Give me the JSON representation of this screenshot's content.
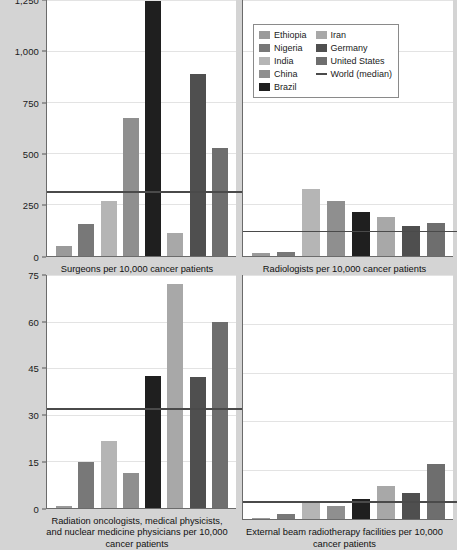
{
  "figure": {
    "background": "#d4d4d4",
    "plot_background": "#ffffff",
    "median_line_color": "#4a4a4a"
  },
  "legend": {
    "position": "top-right",
    "columns": [
      {
        "entries": [
          {
            "label": "Ethiopia",
            "color": "#9a9a9a",
            "marker": "swatch"
          },
          {
            "label": "Nigeria",
            "color": "#787878",
            "marker": "swatch"
          },
          {
            "label": "India",
            "color": "#b5b5b5",
            "marker": "swatch"
          },
          {
            "label": "China",
            "color": "#8f8f8f",
            "marker": "swatch"
          },
          {
            "label": "Brazil",
            "color": "#1f1f1f",
            "marker": "swatch"
          }
        ]
      },
      {
        "entries": [
          {
            "label": "Iran",
            "color": "#a8a8a8",
            "marker": "swatch"
          },
          {
            "label": "Germany",
            "color": "#4f4f4f",
            "marker": "swatch"
          },
          {
            "label": "United States",
            "color": "#6e6e6e",
            "marker": "swatch"
          },
          {
            "label": "World (median)",
            "color": "#4a4a4a",
            "marker": "line"
          }
        ]
      }
    ]
  },
  "series_colors": {
    "Ethiopia": "#9a9a9a",
    "Nigeria": "#787878",
    "India": "#b5b5b5",
    "China": "#8f8f8f",
    "Brazil": "#1f1f1f",
    "Iran": "#a8a8a8",
    "Germany": "#4f4f4f",
    "United States": "#6e6e6e"
  },
  "chart_data": [
    {
      "id": "surgeons",
      "type": "bar",
      "title": "",
      "xlabel": "Surgeons per 10,000 cancer patients",
      "ylabel": "",
      "ylim": [
        0,
        1250
      ],
      "yticks": [
        0,
        250,
        500,
        750,
        1000,
        1250
      ],
      "ytick_labels": [
        "0",
        "250",
        "500",
        "750",
        "1,000",
        "1,250"
      ],
      "grid": true,
      "categories": [
        "Ethiopia",
        "Nigeria",
        "India",
        "China",
        "Brazil",
        "Iran",
        "Germany",
        "United States"
      ],
      "values": [
        48,
        155,
        265,
        675,
        1243,
        108,
        888,
        528
      ],
      "annotations": [
        {
          "name": "World (median)",
          "type": "hline",
          "value": 308
        }
      ]
    },
    {
      "id": "radiologists",
      "type": "bar",
      "title": "",
      "xlabel": "Radiologists per 10,000 cancer patients",
      "ylabel": "",
      "ylim": [
        0,
        1250
      ],
      "yticks": [
        0,
        250,
        500,
        750,
        1000,
        1250
      ],
      "ytick_labels": [
        "0",
        "250",
        "500",
        "750",
        "1,000",
        "1,250"
      ],
      "grid": true,
      "categories": [
        "Ethiopia",
        "Nigeria",
        "India",
        "China",
        "Brazil",
        "Iran",
        "Germany",
        "United States"
      ],
      "values": [
        10,
        18,
        325,
        265,
        213,
        190,
        145,
        158
      ],
      "annotations": [
        {
          "name": "World (median)",
          "type": "hline",
          "value": 113
        }
      ]
    },
    {
      "id": "radiation-oncologists",
      "type": "bar",
      "title": "",
      "xlabel": "Radiation oncologists, medical physicists, and nuclear medicine physicians per 10,000 cancer patients",
      "ylabel": "",
      "ylim": [
        0,
        75
      ],
      "yticks": [
        0,
        15,
        30,
        45,
        60,
        75
      ],
      "ytick_labels": [
        "0",
        "15",
        "30",
        "45",
        "60",
        "75"
      ],
      "grid": true,
      "categories": [
        "Ethiopia",
        "Nigeria",
        "India",
        "China",
        "Brazil",
        "Iran",
        "Germany",
        "United States"
      ],
      "values": [
        0.4,
        14.8,
        21.5,
        11.0,
        42.3,
        72.0,
        42.0,
        60.0
      ],
      "annotations": [
        {
          "name": "World (median)",
          "type": "hline",
          "value": 31.5
        }
      ]
    },
    {
      "id": "radiotherapy-facilities",
      "type": "bar",
      "title": "",
      "xlabel": "External beam radiotherapy facilities per 10,000 cancer patients",
      "ylabel": "",
      "ylim": [
        0,
        75
      ],
      "yticks": [
        0,
        15,
        30,
        45,
        60,
        75
      ],
      "ytick_labels": [
        "0",
        "15",
        "30",
        "45",
        "60",
        "75"
      ],
      "grid": true,
      "categories": [
        "Ethiopia",
        "Nigeria",
        "India",
        "China",
        "Brazil",
        "Iran",
        "Germany",
        "United States"
      ],
      "values": [
        0.3,
        1.4,
        5.2,
        4.0,
        6.2,
        10.2,
        8.0,
        16.8
      ],
      "annotations": [
        {
          "name": "World (median)",
          "type": "hline",
          "value": 5.0
        }
      ]
    }
  ]
}
